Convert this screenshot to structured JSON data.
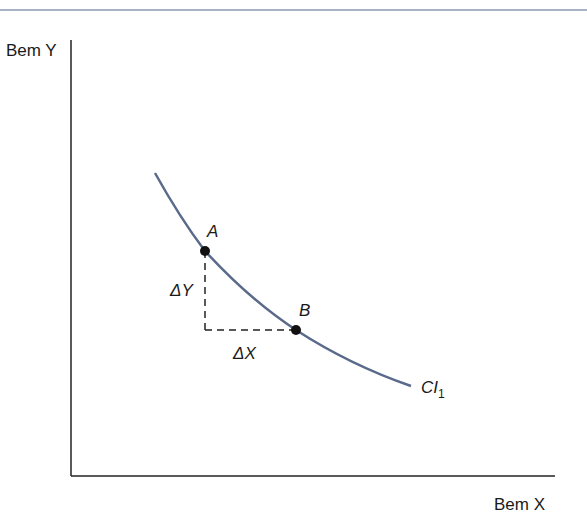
{
  "diagram": {
    "type": "indifference-curve",
    "axes": {
      "y_label": "Bem Y",
      "x_label": "Bem X"
    },
    "curve": {
      "label_main": "CI",
      "label_sub": "1",
      "color": "#5a6a8a"
    },
    "points": [
      {
        "label": "A"
      },
      {
        "label": "B"
      }
    ],
    "deltas": {
      "dy": "ΔY",
      "dx": "ΔX"
    },
    "colors": {
      "top_rule": "#8a9ab0",
      "axis": "#222222",
      "point": "#111111"
    }
  }
}
